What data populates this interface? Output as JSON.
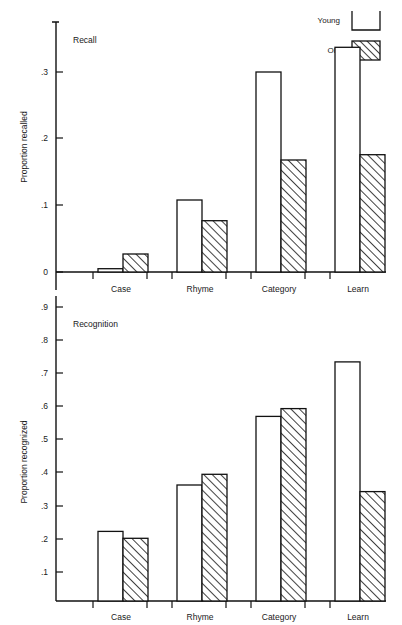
{
  "figure": {
    "width": 402,
    "height": 625,
    "background": "#ffffff",
    "ink_color": "#111111"
  },
  "legend": {
    "position": "top-right",
    "entries": [
      {
        "label": "Young",
        "swatch": "open-box"
      },
      {
        "label": "Old",
        "swatch": "hatched-box"
      }
    ]
  },
  "chart_data": [
    {
      "type": "bar",
      "title": "Recall",
      "panel": "top",
      "xlabel": "",
      "ylabel": "Proportion recalled",
      "categories": [
        "Case",
        "Rhyme",
        "Category",
        "Learn"
      ],
      "ylim": [
        0,
        0.355
      ],
      "yticks": [
        0,
        0.1,
        0.2,
        0.3
      ],
      "ytick_labels": [
        "0",
        ".1",
        ".2",
        ".3"
      ],
      "grid": false,
      "legend_position": "figure-top-right",
      "series": [
        {
          "name": "Young",
          "style": "open",
          "values": [
            0.005,
            0.108,
            0.316,
            0.337
          ]
        },
        {
          "name": "Old",
          "style": "hatched",
          "values": [
            0.027,
            0.077,
            0.168,
            0.176
          ]
        }
      ]
    },
    {
      "type": "bar",
      "title": "Recognition",
      "panel": "bottom",
      "xlabel": "",
      "ylabel": "Proportion recognized",
      "categories": [
        "Case",
        "Rhyme",
        "Category",
        "Learn"
      ],
      "ylim": [
        0,
        0.95
      ],
      "yticks": [
        0.1,
        0.2,
        0.3,
        0.4,
        0.5,
        0.6,
        0.7,
        0.8,
        0.9
      ],
      "ytick_labels": [
        ".1",
        ".2",
        ".3",
        ".4",
        ".5",
        ".6",
        ".7",
        ".8",
        ".9"
      ],
      "grid": false,
      "legend_position": "none",
      "series": [
        {
          "name": "Young",
          "style": "open",
          "values": [
            0.213,
            0.355,
            0.565,
            0.732
          ]
        },
        {
          "name": "Old",
          "style": "hatched",
          "values": [
            0.192,
            0.388,
            0.589,
            0.335
          ]
        }
      ]
    }
  ]
}
